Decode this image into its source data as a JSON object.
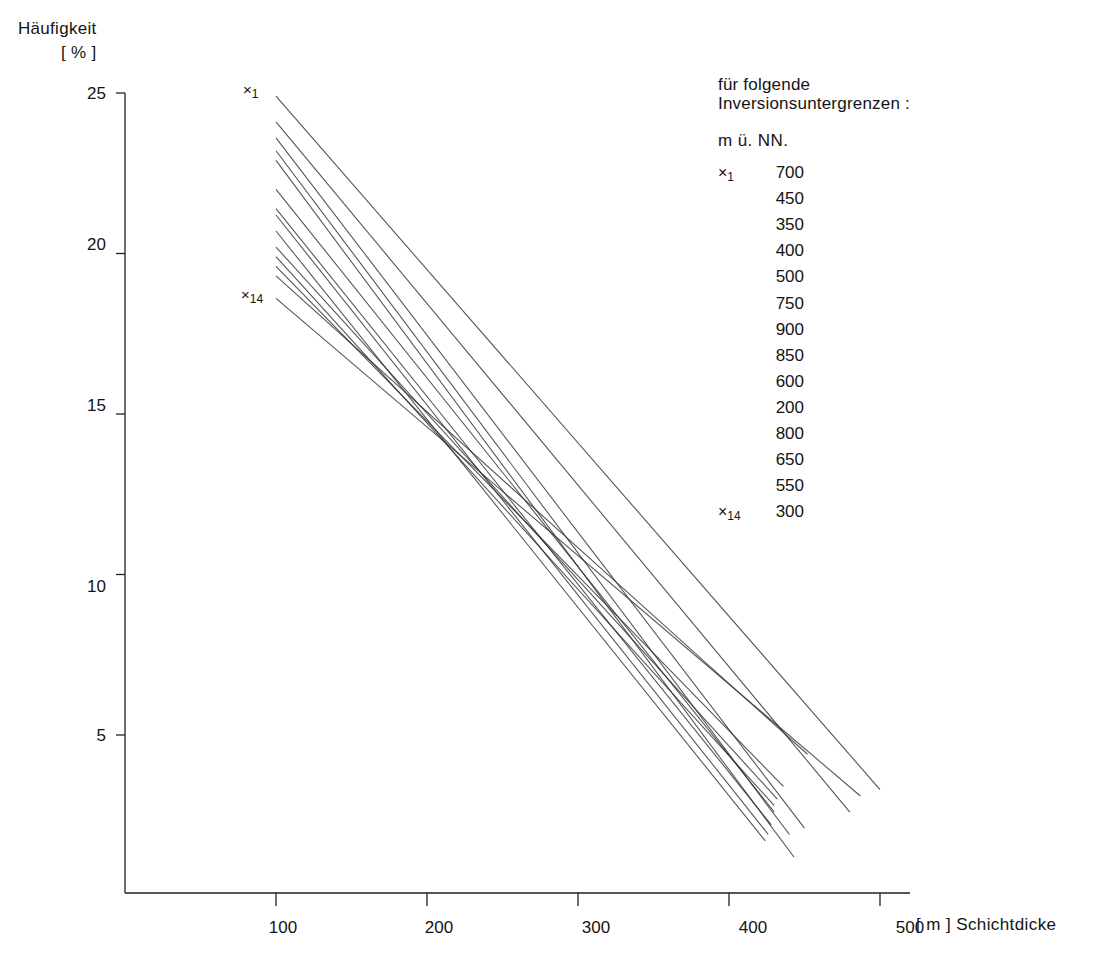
{
  "figure": {
    "background": "#ffffff",
    "line_color": "#2b2b2b",
    "axis_color": "#1f1f1f",
    "text_color": "#141414"
  },
  "axes": {
    "y_title_line1": "Häufigkeit",
    "y_title_line2": "[ % ]",
    "x_title": "[ m ]  Schichtdicke",
    "y_ticks": [
      "25",
      "20",
      "15",
      "10",
      "5"
    ],
    "x_ticks": [
      "100",
      "200",
      "300",
      "400",
      "500"
    ]
  },
  "markers": {
    "first_cross": "×",
    "first_index": "1",
    "last_cross": "×",
    "last_index": "14"
  },
  "legend": {
    "head_line1": "für folgende",
    "head_line2": "Inversionsuntergrenzen :",
    "units": "m  ü.  NN.",
    "rows": [
      {
        "tag_cross": "×",
        "tag_index": "1",
        "value": "700"
      },
      {
        "tag_cross": "",
        "tag_index": "",
        "value": "450"
      },
      {
        "tag_cross": "",
        "tag_index": "",
        "value": "350"
      },
      {
        "tag_cross": "",
        "tag_index": "",
        "value": "400"
      },
      {
        "tag_cross": "",
        "tag_index": "",
        "value": "500"
      },
      {
        "tag_cross": "",
        "tag_index": "",
        "value": "750"
      },
      {
        "tag_cross": "",
        "tag_index": "",
        "value": "900"
      },
      {
        "tag_cross": "",
        "tag_index": "",
        "value": "850"
      },
      {
        "tag_cross": "",
        "tag_index": "",
        "value": "600"
      },
      {
        "tag_cross": "",
        "tag_index": "",
        "value": "200"
      },
      {
        "tag_cross": "",
        "tag_index": "",
        "value": "800"
      },
      {
        "tag_cross": "",
        "tag_index": "",
        "value": "650"
      },
      {
        "tag_cross": "",
        "tag_index": "",
        "value": "550"
      },
      {
        "tag_cross": "×",
        "tag_index": "14",
        "value": "300"
      }
    ]
  },
  "chart_data": {
    "type": "line",
    "title": "",
    "xlabel": "[ m ]  Schichtdicke",
    "ylabel": "Häufigkeit [ % ]",
    "xlim": [
      0,
      520
    ],
    "ylim": [
      0,
      26
    ],
    "x_ticks": [
      100,
      200,
      300,
      400,
      500
    ],
    "y_ticks": [
      5,
      10,
      15,
      20,
      25
    ],
    "grid": false,
    "legend_position": "right",
    "legend_title": "für folgende Inversionsuntergrenzen : m ü. NN.",
    "note": "14 straight regression lines, all beginning at Schichtdicke = 100 m; each line corresponds to one inversion lower-limit altitude. x and y are read off the axes; endpoints estimated from the plotted segments.",
    "series": [
      {
        "name": "x1 — 700 m ü. NN.",
        "label": "700",
        "index": 1,
        "x": [
          100,
          500
        ],
        "y": [
          24.9,
          3.3
        ]
      },
      {
        "name": "450 m ü. NN.",
        "label": "450",
        "index": 2,
        "x": [
          100,
          480
        ],
        "y": [
          24.1,
          2.6
        ]
      },
      {
        "name": "350 m ü. NN.",
        "label": "350",
        "index": 3,
        "x": [
          100,
          450
        ],
        "y": [
          23.6,
          2.1
        ]
      },
      {
        "name": "400 m ü. NN.",
        "label": "400",
        "index": 4,
        "x": [
          100,
          440
        ],
        "y": [
          23.2,
          1.9
        ]
      },
      {
        "name": "500 m ü. NN.",
        "label": "500",
        "index": 5,
        "x": [
          100,
          443
        ],
        "y": [
          22.9,
          1.2
        ]
      },
      {
        "name": "750 m ü. NN.",
        "label": "750",
        "index": 6,
        "x": [
          100,
          430
        ],
        "y": [
          22.0,
          2.6
        ]
      },
      {
        "name": "900 m ü. NN.",
        "label": "900",
        "index": 7,
        "x": [
          100,
          428
        ],
        "y": [
          21.4,
          2.2
        ]
      },
      {
        "name": "850 m ü. NN.",
        "label": "850",
        "index": 8,
        "x": [
          100,
          426
        ],
        "y": [
          21.2,
          1.9
        ]
      },
      {
        "name": "600 m ü. NN.",
        "label": "600",
        "index": 9,
        "x": [
          100,
          424
        ],
        "y": [
          20.7,
          1.7
        ]
      },
      {
        "name": "200 m ü. NN.",
        "label": "200",
        "index": 10,
        "x": [
          100,
          432
        ],
        "y": [
          20.2,
          3.0
        ]
      },
      {
        "name": "800 m ü. NN.",
        "label": "800",
        "index": 11,
        "x": [
          100,
          430
        ],
        "y": [
          19.9,
          2.8
        ]
      },
      {
        "name": "650 m ü. NN.",
        "label": "650",
        "index": 12,
        "x": [
          100,
          436
        ],
        "y": [
          19.6,
          3.4
        ]
      },
      {
        "name": "550 m ü. NN.",
        "label": "550",
        "index": 13,
        "x": [
          100,
          452
        ],
        "y": [
          19.3,
          4.4
        ]
      },
      {
        "name": "x14 — 300 m ü. NN.",
        "label": "300",
        "index": 14,
        "x": [
          100,
          487
        ],
        "y": [
          18.6,
          3.1
        ]
      }
    ]
  }
}
